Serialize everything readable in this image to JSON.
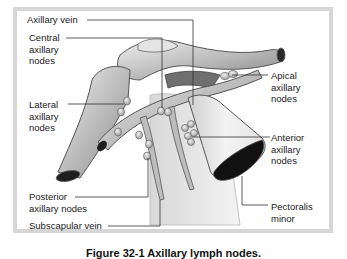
{
  "figure": {
    "caption_title": "Figure 32-1",
    "caption_text": "Axillary lymph nodes."
  },
  "labels": {
    "axillary_vein": "Axillary vein",
    "central_nodes": "Central\naxillary\nnodes",
    "lateral_nodes": "Lateral\naxillary\nnodes",
    "posterior_nodes": "Posterior\naxillary nodes",
    "subscapular_vein": "Subscapular vein",
    "apical_nodes": "Apical\naxillary\nnodes",
    "anterior_nodes": "Anterior\naxillary\nnodes",
    "pectoralis_minor": "Pectoralis\nminor"
  },
  "colors": {
    "frame": "#d6d6d6",
    "structure_fill": "#bdbdbd",
    "structure_light": "#e6e6e6",
    "structure_dark": "#7a7a7a",
    "lumen": "#1a1a1a",
    "leader_line": "#333333"
  }
}
